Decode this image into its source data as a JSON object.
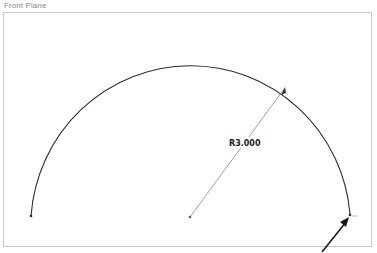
{
  "viewport": {
    "plane_label": "Front Plane"
  },
  "sketch": {
    "entity": "arc",
    "dimension": {
      "label": "R3.000",
      "type": "radius"
    }
  },
  "colors": {
    "arc": "#2a2a2a",
    "dimension_line": "#555555",
    "frame": "#c8c8c8",
    "label": "#8a8a8a",
    "cursor": "#1a1a1a"
  }
}
